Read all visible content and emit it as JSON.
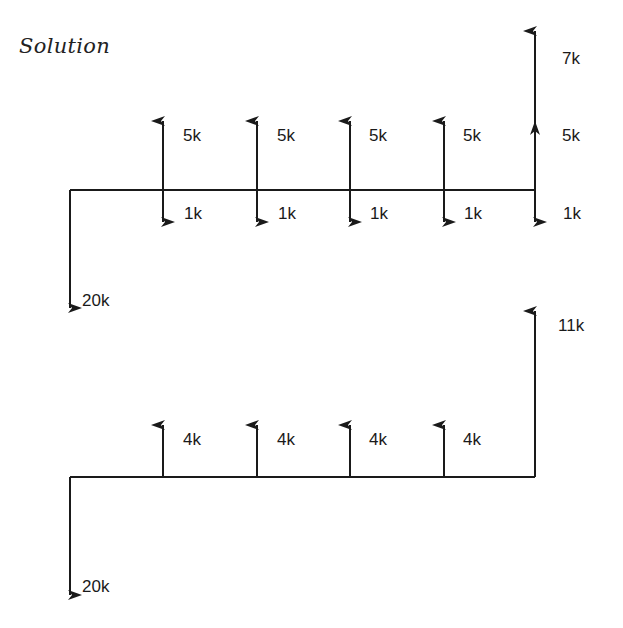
{
  "heading": "Solution",
  "diagram_1": {
    "initial": {
      "label": "20k",
      "direction": "down"
    },
    "periods": [
      {
        "up_label": "5k",
        "down_label": "1k"
      },
      {
        "up_label": "5k",
        "down_label": "1k"
      },
      {
        "up_label": "5k",
        "down_label": "1k"
      },
      {
        "up_label": "5k",
        "down_label": "1k"
      },
      {
        "up_label": "5k",
        "down_label": "1k",
        "extra_up_label": "7k"
      }
    ]
  },
  "diagram_2": {
    "initial": {
      "label": "20k",
      "direction": "down"
    },
    "periods": [
      {
        "up_label": "4k"
      },
      {
        "up_label": "4k"
      },
      {
        "up_label": "4k"
      },
      {
        "up_label": "4k"
      },
      {
        "up_label": "11k"
      }
    ]
  },
  "colors": {
    "ink": "#1a1a1a",
    "background": "#ffffff"
  }
}
